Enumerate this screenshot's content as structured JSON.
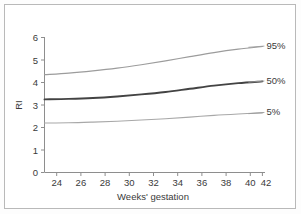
{
  "figure": {
    "background_color": "#ffffff",
    "frame_color": "#b9b9b9"
  },
  "chart_data": {
    "type": "line",
    "title": "",
    "xlabel": "Weeks' gestation",
    "ylabel": "RI",
    "xlim": [
      23,
      43
    ],
    "ylim": [
      0,
      6
    ],
    "xticks": [
      24,
      26,
      28,
      30,
      32,
      34,
      36,
      38,
      40,
      42
    ],
    "xtick_labels": [
      "24",
      "26",
      "28",
      "30",
      "32",
      "34",
      "36",
      "38",
      "40",
      "42"
    ],
    "yticks": [
      0,
      1,
      2,
      3,
      4,
      5,
      6
    ],
    "ytick_labels": [
      "0",
      "1",
      "2",
      "3",
      "4",
      "5",
      "6"
    ],
    "grid": false,
    "legend_position": "right-inline-labels",
    "x": [
      24,
      26,
      28,
      30,
      32,
      34,
      36,
      38,
      40,
      42
    ],
    "series": [
      {
        "name": "95%",
        "label": "95%",
        "color": "#9c9c9c",
        "line_width": 1.2,
        "values": [
          4.35,
          4.42,
          4.52,
          4.64,
          4.79,
          4.96,
          5.15,
          5.33,
          5.48,
          5.6
        ]
      },
      {
        "name": "50%",
        "label": "50%",
        "color": "#434343",
        "line_width": 1.9,
        "values": [
          3.25,
          3.27,
          3.31,
          3.38,
          3.47,
          3.58,
          3.72,
          3.86,
          3.97,
          4.05
        ]
      },
      {
        "name": "5%",
        "label": "5%",
        "color": "#a8a8a8",
        "line_width": 1.1,
        "values": [
          2.2,
          2.21,
          2.24,
          2.28,
          2.33,
          2.39,
          2.46,
          2.54,
          2.6,
          2.65
        ]
      }
    ],
    "annotations": [
      {
        "text": "95%",
        "at_x": 42,
        "at_y": 5.6
      },
      {
        "text": "50%",
        "at_x": 42,
        "at_y": 4.05
      },
      {
        "text": "5%",
        "at_x": 42,
        "at_y": 2.65
      }
    ]
  }
}
